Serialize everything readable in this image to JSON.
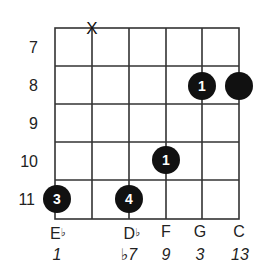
{
  "diagram": {
    "type": "guitar-chord-diagram",
    "start_fret": 7,
    "fret_labels": [
      "7",
      "8",
      "9",
      "10",
      "11"
    ],
    "strings": 6,
    "muted_string_index": 1,
    "mute_symbol": "X",
    "fingers": [
      {
        "string": 0,
        "fret": 11,
        "finger": "3"
      },
      {
        "string": 2,
        "fret": 11,
        "finger": "4"
      },
      {
        "string": 3,
        "fret": 10,
        "finger": "2"
      },
      {
        "string": 4,
        "fret": 8,
        "finger": "1"
      },
      {
        "string": 5,
        "fret": 8,
        "finger": "1"
      }
    ],
    "notes": [
      {
        "string": 0,
        "letter": "E",
        "accidental": "♭"
      },
      {
        "string": 2,
        "letter": "D",
        "accidental": "♭"
      },
      {
        "string": 3,
        "letter": "F",
        "accidental": ""
      },
      {
        "string": 4,
        "letter": "G",
        "accidental": ""
      },
      {
        "string": 5,
        "letter": "C",
        "accidental": ""
      }
    ],
    "intervals": [
      {
        "string": 0,
        "label": "1"
      },
      {
        "string": 2,
        "label": "♭7"
      },
      {
        "string": 3,
        "label": "9"
      },
      {
        "string": 4,
        "label": "3"
      },
      {
        "string": 5,
        "label": "13"
      }
    ],
    "colors": {
      "line": "#333333",
      "dot": "#111111",
      "dot_text": "#ffffff"
    }
  }
}
